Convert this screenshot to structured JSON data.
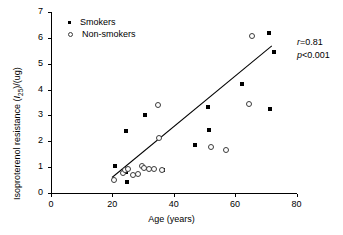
{
  "chart_data": {
    "type": "scatter",
    "title": "",
    "xlabel": "Age (years)",
    "ylabel_text": "Isoproterenol resistance (I25)/(ug)",
    "ylabel_prefix": "Isoproterenol resistance (",
    "ylabel_symbol": "I",
    "ylabel_sub": "25",
    "ylabel_suffix": ")/(ug)",
    "xlim": [
      0,
      80
    ],
    "ylim": [
      0,
      7
    ],
    "xticks": [
      0,
      20,
      40,
      60,
      80
    ],
    "yticks": [
      0,
      1,
      2,
      3,
      4,
      5,
      6,
      7
    ],
    "grid": false,
    "legend_position": "top-left",
    "series": [
      {
        "name": "Smokers",
        "marker": "filled-square",
        "color": "#000000",
        "points": [
          [
            21.0,
            1.05
          ],
          [
            24.3,
            0.82
          ],
          [
            24.8,
            0.42
          ],
          [
            24.6,
            2.4
          ],
          [
            30.6,
            3.02
          ],
          [
            36.5,
            0.88
          ],
          [
            46.8,
            1.85
          ],
          [
            51.2,
            3.34
          ],
          [
            51.4,
            2.44
          ],
          [
            62.2,
            4.22
          ],
          [
            71.2,
            6.17
          ],
          [
            72.8,
            5.44
          ],
          [
            71.5,
            3.26
          ]
        ]
      },
      {
        "name": "Non-smokers",
        "marker": "open-circle",
        "color": "#3c3c3c",
        "points": [
          [
            20.6,
            0.52
          ],
          [
            23.4,
            0.78
          ],
          [
            24.2,
            0.88
          ],
          [
            25.0,
            0.92
          ],
          [
            26.6,
            0.7
          ],
          [
            28.3,
            0.72
          ],
          [
            29.6,
            1.05
          ],
          [
            30.2,
            0.98
          ],
          [
            31.8,
            0.92
          ],
          [
            33.6,
            0.92
          ],
          [
            34.8,
            3.42
          ],
          [
            35.2,
            2.12
          ],
          [
            36.2,
            0.9
          ],
          [
            52.0,
            1.76
          ],
          [
            57.0,
            1.66
          ],
          [
            64.6,
            3.44
          ],
          [
            65.4,
            6.08
          ]
        ]
      }
    ],
    "fit_line": {
      "name": "regression-line",
      "x_start": 20.0,
      "y_start": 0.62,
      "x_end": 72.2,
      "y_end": 5.72
    },
    "annotations": [
      {
        "name": "correlation",
        "symbol": "r",
        "relation": "=",
        "value": "0.81"
      },
      {
        "name": "p-value",
        "symbol": "p",
        "relation": "<",
        "value": "0.001"
      }
    ],
    "legend_entries": [
      {
        "label": "Smokers",
        "marker": "filled-square"
      },
      {
        "label": "Non-smokers",
        "marker": "open-circle"
      }
    ]
  }
}
